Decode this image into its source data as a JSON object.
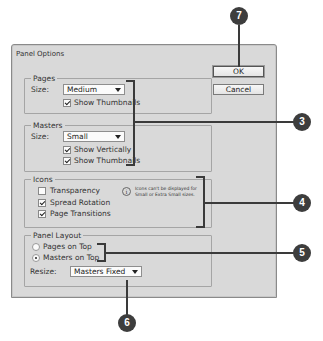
{
  "dialog": {
    "title": "Panel Options",
    "buttons": {
      "ok": "OK",
      "cancel": "Cancel"
    },
    "pages": {
      "legend": "Pages",
      "size_label": "Size:",
      "size_value": "Medium",
      "show_thumbnails": {
        "label": "Show Thumbnails",
        "checked": true
      }
    },
    "masters": {
      "legend": "Masters",
      "size_label": "Size:",
      "size_value": "Small",
      "show_vertically": {
        "label": "Show Vertically",
        "checked": true
      },
      "show_thumbnails": {
        "label": "Show Thumbnails",
        "checked": true
      }
    },
    "icons": {
      "legend": "Icons",
      "transparency": {
        "label": "Transparency",
        "checked": false
      },
      "spread_rotation": {
        "label": "Spread Rotation",
        "checked": true
      },
      "page_transitions": {
        "label": "Page Transitions",
        "checked": true
      },
      "info_icon": "i",
      "note": "Icons can't be displayed for Small or Extra Small sizes."
    },
    "panel_layout": {
      "legend": "Panel Layout",
      "pages_on_top": {
        "label": "Pages on Top",
        "selected": false
      },
      "masters_on_top": {
        "label": "Masters on Top",
        "selected": true
      },
      "resize_label": "Resize:",
      "resize_value": "Masters Fixed"
    }
  },
  "callouts": {
    "c3": "3",
    "c4": "4",
    "c5": "5",
    "c6": "6",
    "c7": "7"
  },
  "colors": {
    "dialog_bg": "#d9d9d9",
    "callout_bg": "#3d3d3d",
    "leader_line": "#3a3a3a"
  }
}
